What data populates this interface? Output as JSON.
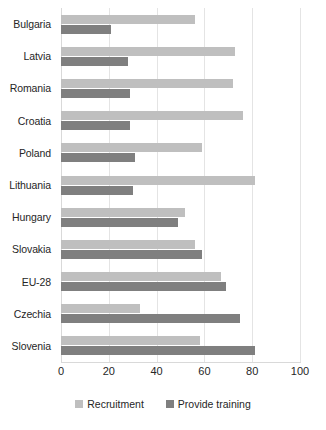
{
  "chart_data": {
    "type": "bar",
    "orientation": "horizontal",
    "title": "",
    "xlabel": "",
    "ylabel": "",
    "xlim": [
      0,
      100
    ],
    "xticks": [
      0,
      20,
      40,
      60,
      80,
      100
    ],
    "grid": true,
    "legend_position": "bottom",
    "categories": [
      "Bulgaria",
      "Latvia",
      "Romania",
      "Croatia",
      "Poland",
      "Lithuania",
      "Hungary",
      "Slovakia",
      "EU-28",
      "Czechia",
      "Slovenia"
    ],
    "series": [
      {
        "name": "Recruitment",
        "color": "#BFBFBF",
        "values": [
          56,
          73,
          72,
          76,
          59,
          81,
          52,
          56,
          67,
          33,
          58
        ]
      },
      {
        "name": "Provide training",
        "color": "#7F7F7F",
        "values": [
          21,
          28,
          29,
          29,
          31,
          30,
          49,
          59,
          69,
          75,
          81
        ]
      }
    ]
  }
}
